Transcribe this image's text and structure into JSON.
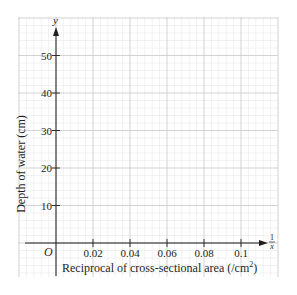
{
  "chart_data": {
    "type": "line",
    "title": "",
    "xlabel": "Reciprocal of cross-sectional area (/cm",
    "xlabel_superscript": "2",
    "xlabel_close": ")",
    "ylabel": "Depth of water (cm)",
    "x_axis_symbol_numerator": "1",
    "x_axis_symbol_denominator": "x",
    "y_axis_symbol": "y",
    "origin_label": "O",
    "x_ticks": [
      0.02,
      0.04,
      0.06,
      0.08,
      0.1
    ],
    "x_tick_labels": [
      "0.02",
      "0.04",
      "0.06",
      "0.08",
      "0.1"
    ],
    "y_ticks": [
      10,
      20,
      30,
      40,
      50
    ],
    "y_tick_labels": [
      "10",
      "20",
      "30",
      "40",
      "50"
    ],
    "xlim": [
      -0.0165,
      0.12
    ],
    "ylim": [
      -9,
      60
    ],
    "grid": true,
    "grid_minor_subdivisions": 5,
    "series": [],
    "legend": null
  },
  "colors": {
    "axis": "#231f20",
    "grid_major": "#c8c8c8",
    "grid_minor": "#e4e4e4",
    "background": "#ffffff"
  }
}
